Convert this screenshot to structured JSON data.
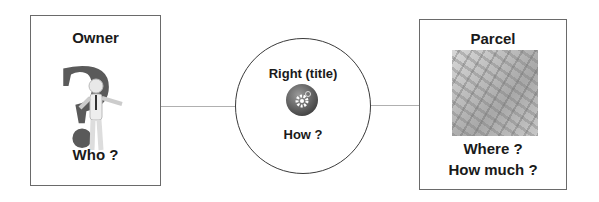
{
  "owner": {
    "title": "Owner",
    "question": "Who ?"
  },
  "right": {
    "title": "Right (title)",
    "question": "How ?"
  },
  "parcel": {
    "title": "Parcel",
    "question1": "Where ?",
    "question2": "How much ?"
  }
}
